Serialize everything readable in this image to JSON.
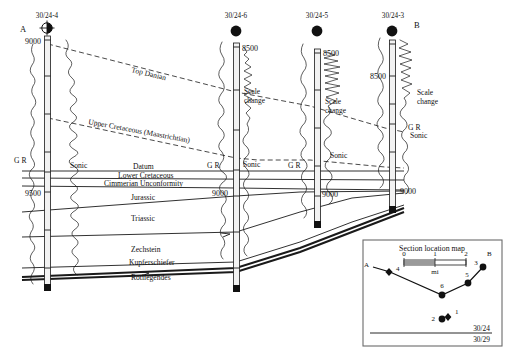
{
  "figure": {
    "type": "well-log-correlation-cross-section",
    "left_end_label": "A",
    "right_end_label": "B"
  },
  "wells": [
    {
      "name": "30/24-4",
      "symbol": "deviated-well-symbol",
      "depth_markers": [
        "9000",
        "9500"
      ],
      "curve_labels": [
        "G R",
        "Sonic"
      ],
      "scale_change": ""
    },
    {
      "name": "30/24-6",
      "symbol": "vertical-well-symbol",
      "depth_markers": [
        "8500",
        "9000"
      ],
      "curve_labels": [
        "G R",
        "Sonic"
      ],
      "scale_change": "Scale\nchange"
    },
    {
      "name": "30/24-5",
      "symbol": "vertical-well-symbol",
      "depth_markers": [
        "8500",
        "9000"
      ],
      "curve_labels": [
        "G R",
        "Sonic"
      ],
      "scale_change": "Scale\nchange"
    },
    {
      "name": "30/24-3",
      "symbol": "vertical-well-symbol",
      "depth_markers": [
        "8500",
        "9000"
      ],
      "curve_labels": [
        "G R",
        "Sonic"
      ],
      "scale_change": "Scale\nchange"
    }
  ],
  "well_names": {
    "w4": "30/24-4",
    "w6": "30/24-6",
    "w5": "30/24-5",
    "w3": "30/24-3"
  },
  "depth_labels": {
    "w4_9000": "9000",
    "w4_9500": "9500",
    "w6_8500": "8500",
    "w6_9000": "9000",
    "w5_8500": "8500",
    "w5_9000": "9000",
    "w3_8500": "8500",
    "w3_9000": "9000"
  },
  "curve_labels": {
    "gr_w4": "G R",
    "sonic_w4": "Sonic",
    "gr_w6": "G R",
    "sonic_w6": "Sonic",
    "gr_w5": "G R",
    "sonic_w5": "Sonic",
    "gr_w3": "G R",
    "sonic_w3": "Sonic"
  },
  "scale_change_labels": {
    "w6_line1": "Scale",
    "w6_line2": "change",
    "w5_line1": "Scale",
    "w5_line2": "change",
    "w3_line1": "Scale",
    "w3_line2": "change"
  },
  "horizons": [
    {
      "label": "Top Danian",
      "style": "dashed"
    },
    {
      "label": "Upper Cretaceous (Maastrichtian)",
      "style": "dashed"
    },
    {
      "label": "Datum",
      "style": "solid"
    },
    {
      "label": "Lower Cretaceous",
      "style": "solid"
    },
    {
      "label": "Cimmerian Unconformity",
      "style": "solid"
    },
    {
      "label": "Jurassic",
      "style": "solid"
    },
    {
      "label": "Triassic",
      "style": "solid"
    },
    {
      "label": "Zechstein",
      "style": "solid"
    },
    {
      "label": "Kupferschiefer",
      "style": "thick"
    },
    {
      "label": "Rotliegendes",
      "style": "thick"
    }
  ],
  "horizon_labels": {
    "top_danian": "Top Danian",
    "upper_cretaceous": "Upper Cretaceous (Maastrichtian)",
    "datum": "Datum",
    "lower_cretaceous": "Lower Cretaceous",
    "cimmerian": "Cimmerian Unconformity",
    "jurassic": "Jurassic",
    "triassic": "Triassic",
    "zechstein": "Zechstein",
    "kupferschiefer": "Kupferschiefer",
    "rotliegendes": "Rotliegendes"
  },
  "ends": {
    "left": "A",
    "right": "B"
  },
  "inset_map": {
    "title": "Section location map",
    "scale_ticks": [
      "0",
      "1",
      "2"
    ],
    "scale_unit": "mi",
    "end_a": "A",
    "end_b": "B",
    "well_numbers": [
      "4",
      "6",
      "5",
      "3",
      "1",
      "2"
    ],
    "blocks": {
      "upper": "30/24",
      "lower": "30/29"
    }
  },
  "inset_wells": {
    "n4": "4",
    "n6": "6",
    "n5": "5",
    "n3": "3",
    "n1": "1",
    "n2": "2"
  },
  "colors": {
    "ink": "#111111",
    "track_fill": "#f2f2f2",
    "frame": "#6b6b6b",
    "scale_fill": "#9a9a9a"
  }
}
